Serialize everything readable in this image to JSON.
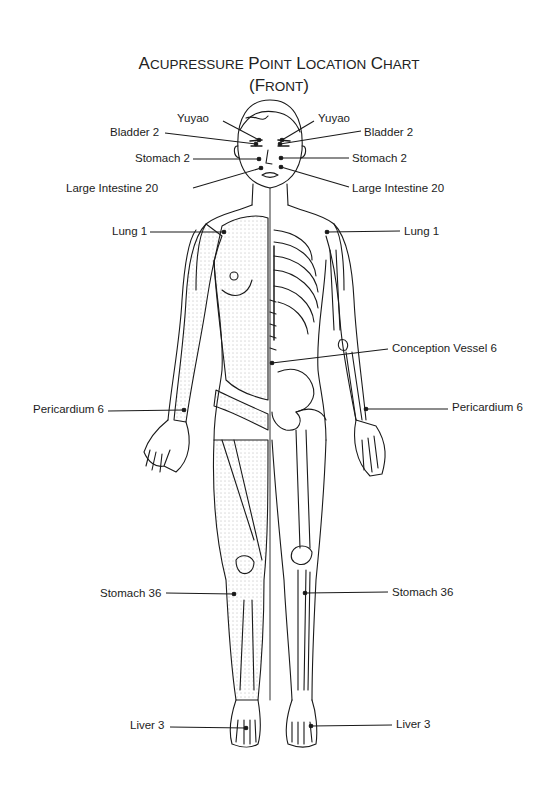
{
  "title": {
    "line1": [
      {
        "cap": "A",
        "rest": "CUPRESSURE"
      },
      {
        "cap": "P",
        "rest": "OINT"
      },
      {
        "cap": "L",
        "rest": "OCATION"
      },
      {
        "cap": "C",
        "rest": "HART"
      }
    ],
    "line2": {
      "open": "(",
      "cap": "F",
      "rest": "RONT",
      "close": ")"
    },
    "full_text": "Acupressure Point Location Chart (Front)"
  },
  "colors": {
    "line": "#1a1a1a",
    "stipple": "#777777",
    "background": "#ffffff"
  },
  "points": [
    {
      "id": "yuyao-left",
      "label": "Yuyao",
      "side": "left",
      "lx": 177,
      "ly": 112,
      "x1": 223,
      "y1": 121,
      "x2": 259,
      "y2": 140
    },
    {
      "id": "yuyao-right",
      "label": "Yuyao",
      "side": "right",
      "lx": 318,
      "ly": 112,
      "x1": 314,
      "y1": 121,
      "x2": 282,
      "y2": 140
    },
    {
      "id": "bladder2-left",
      "label": "Bladder 2",
      "side": "left",
      "lx": 110,
      "ly": 126,
      "x1": 165,
      "y1": 133,
      "x2": 256,
      "y2": 144
    },
    {
      "id": "bladder2-right",
      "label": "Bladder 2",
      "side": "right",
      "lx": 364,
      "ly": 126,
      "x1": 361,
      "y1": 131,
      "x2": 280,
      "y2": 144
    },
    {
      "id": "stomach2-left",
      "label": "Stomach 2",
      "side": "left",
      "lx": 135,
      "ly": 152,
      "x1": 193,
      "y1": 159,
      "x2": 259,
      "y2": 159
    },
    {
      "id": "stomach2-right",
      "label": "Stomach 2",
      "side": "right",
      "lx": 352,
      "ly": 152,
      "x1": 349,
      "y1": 158,
      "x2": 281,
      "y2": 158
    },
    {
      "id": "li20-left",
      "label": "Large Intestine 20",
      "side": "left",
      "lx": 66,
      "ly": 182,
      "x1": 193,
      "y1": 188,
      "x2": 261,
      "y2": 168
    },
    {
      "id": "li20-right",
      "label": "Large Intestine 20",
      "side": "right",
      "lx": 352,
      "ly": 182,
      "x1": 349,
      "y1": 187,
      "x2": 281,
      "y2": 167
    },
    {
      "id": "lung1-left",
      "label": "Lung 1",
      "side": "left",
      "lx": 112,
      "ly": 225,
      "x1": 150,
      "y1": 232,
      "x2": 224,
      "y2": 232
    },
    {
      "id": "lung1-right",
      "label": "Lung 1",
      "side": "right",
      "lx": 404,
      "ly": 225,
      "x1": 400,
      "y1": 231,
      "x2": 327,
      "y2": 232
    },
    {
      "id": "cv6",
      "label": "Conception Vessel 6",
      "side": "right",
      "lx": 392,
      "ly": 342,
      "x1": 388,
      "y1": 349,
      "x2": 272,
      "y2": 363
    },
    {
      "id": "pc6-left",
      "label": "Pericardium 6",
      "side": "left",
      "lx": 33,
      "ly": 403,
      "x1": 108,
      "y1": 411,
      "x2": 184,
      "y2": 410
    },
    {
      "id": "pc6-right",
      "label": "Pericardium 6",
      "side": "right",
      "lx": 452,
      "ly": 401,
      "x1": 448,
      "y1": 409,
      "x2": 366,
      "y2": 409
    },
    {
      "id": "st36-left",
      "label": "Stomach 36",
      "side": "left",
      "lx": 100,
      "ly": 587,
      "x1": 166,
      "y1": 593,
      "x2": 234,
      "y2": 594
    },
    {
      "id": "st36-right",
      "label": "Stomach 36",
      "side": "right",
      "lx": 392,
      "ly": 586,
      "x1": 388,
      "y1": 592,
      "x2": 305,
      "y2": 593
    },
    {
      "id": "liver3-left",
      "label": "Liver 3",
      "side": "left",
      "lx": 130,
      "ly": 719,
      "x1": 170,
      "y1": 727,
      "x2": 246,
      "y2": 728
    },
    {
      "id": "liver3-right",
      "label": "Liver 3",
      "side": "right",
      "lx": 396,
      "ly": 718,
      "x1": 392,
      "y1": 725,
      "x2": 311,
      "y2": 726
    }
  ]
}
